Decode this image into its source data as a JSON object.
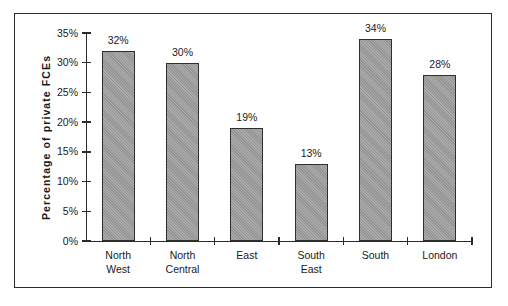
{
  "chart_data": {
    "type": "bar",
    "title": "",
    "xlabel": "",
    "ylabel": "Percentage of private FCEs",
    "categories": [
      "North West",
      "North Central",
      "East",
      "South East",
      "South",
      "London"
    ],
    "category_lines": [
      [
        "North",
        "West"
      ],
      [
        "North",
        "Central"
      ],
      [
        "East"
      ],
      [
        "South",
        "East"
      ],
      [
        "South"
      ],
      [
        "London"
      ]
    ],
    "values": [
      32,
      30,
      19,
      13,
      34,
      28
    ],
    "value_labels": [
      "32%",
      "30%",
      "19%",
      "13%",
      "34%",
      "28%"
    ],
    "ylim": [
      0,
      35
    ],
    "ytick_values": [
      0,
      5,
      10,
      15,
      20,
      25,
      30,
      35
    ],
    "ytick_labels": [
      "0%",
      "5%",
      "10%",
      "15%",
      "20%",
      "25%",
      "30%",
      "35%"
    ],
    "grid": false,
    "legend": false,
    "bar_color": "#9c9c9c",
    "bar_edge_color": "#2f2f2f",
    "axis_color": "#2b2b2b",
    "background": "#ffffff"
  }
}
